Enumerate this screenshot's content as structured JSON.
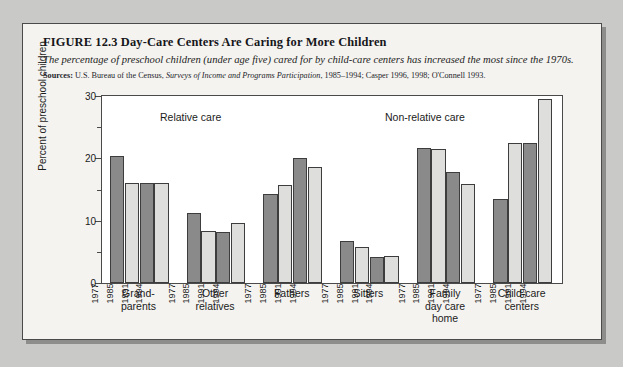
{
  "figure": {
    "title": "FIGURE 12.3  Day-Care Centers Are Caring for More Children",
    "subtitle": "The percentage of preschool children (under age five) cared for by child-care centers has increased the most since the 1970s.",
    "sources_label": "Sources:",
    "sources_part1": " U.S. Bureau of the Census, ",
    "sources_italic": "Surveys of Income and Programs Participation",
    "sources_part2": ", 1985–1994; Casper 1996, 1998; O'Connell 1993."
  },
  "colors": {
    "bar_dark": "#8a8a8a",
    "bar_light": "#dededd",
    "bar_outline": "#3d3d3d",
    "panel_background": "#f4f3f0",
    "page_background": "#c9c9c7",
    "plot_background": "#ffffff"
  },
  "annotations": {
    "relative_care": "Relative care",
    "non_relative_care": "Non-relative care"
  },
  "chart_data": {
    "type": "bar",
    "title": "Day-Care Centers Are Caring for More Children",
    "xlabel": "",
    "ylabel": "Percent of preschool children",
    "ylim": [
      0,
      30
    ],
    "yticks": [
      0,
      10,
      20,
      30
    ],
    "ytick_labels": [
      "0",
      "10",
      "20",
      "30"
    ],
    "yticks_minor": [
      5,
      15,
      25
    ],
    "grid": false,
    "legend": "none",
    "series_labels": [
      "1977",
      "1985",
      "1991",
      "1994"
    ],
    "series_shades": [
      "dark",
      "light",
      "dark",
      "light"
    ],
    "categories": [
      "Grand-parents",
      "Other relatives",
      "Fathers",
      "Sitters",
      "Family day care home",
      "Child-care centers"
    ],
    "category_lines": [
      [
        "Grand-",
        "parents"
      ],
      [
        "Other",
        "relatives"
      ],
      [
        "Fathers"
      ],
      [
        "Sitters"
      ],
      [
        "Family",
        "day care",
        "home"
      ],
      [
        "Child-care",
        "centers"
      ]
    ],
    "groups": [
      {
        "category": "Grand-parents",
        "values": [
          20.3,
          16.0,
          16.0,
          16.0
        ]
      },
      {
        "category": "Other relatives",
        "values": [
          11.2,
          8.4,
          8.2,
          9.7
        ]
      },
      {
        "category": "Fathers",
        "values": [
          14.3,
          15.8,
          20.0,
          18.6
        ]
      },
      {
        "category": "Sitters",
        "values": [
          6.8,
          5.7,
          4.1,
          4.3
        ]
      },
      {
        "category": "Family day care home",
        "values": [
          21.6,
          21.5,
          17.8,
          15.9
        ]
      },
      {
        "category": "Child-care centers",
        "values": [
          13.5,
          22.5,
          22.5,
          29.5
        ]
      }
    ]
  }
}
